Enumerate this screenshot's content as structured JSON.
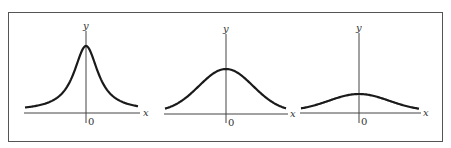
{
  "figure": {
    "panels": [
      {
        "id": "narrow",
        "y_label": "y",
        "x_label": "x",
        "origin_label": "0",
        "axis": {
          "x0": 24,
          "x1": 140,
          "y_axis_x": 86,
          "baseline_y": 113
        },
        "curve": {
          "peak_y": 46,
          "width": 16,
          "shape": "cauchy-like peaked"
        }
      },
      {
        "id": "medium",
        "y_label": "y",
        "x_label": "x",
        "origin_label": "0",
        "axis": {
          "x0": 164,
          "x1": 288,
          "y_axis_x": 226,
          "baseline_y": 114
        },
        "curve": {
          "peak_y": 69,
          "width": 27,
          "shape": "gaussian"
        }
      },
      {
        "id": "wide",
        "y_label": "y",
        "x_label": "x",
        "origin_label": "0",
        "axis": {
          "x0": 300,
          "x1": 421,
          "y_axis_x": 359,
          "baseline_y": 113
        },
        "curve": {
          "peak_y": 94,
          "width": 30,
          "shape": "gaussian"
        }
      }
    ],
    "colors": {
      "curve": "#1a1a1a",
      "axis": "#444444",
      "frame": "#555555"
    }
  }
}
